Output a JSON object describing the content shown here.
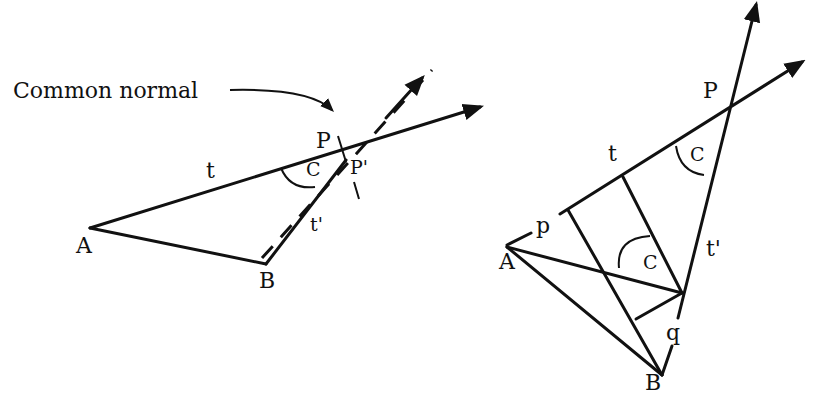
{
  "left_figure": {
    "annotation": "Common normal",
    "labels": {
      "A": "A",
      "B": "B",
      "P": "P",
      "P_prime": "P'",
      "t": "t",
      "t_prime": "t'",
      "angle": "C"
    }
  },
  "right_figure": {
    "labels": {
      "A": "A",
      "B": "B",
      "P": "P",
      "t": "t",
      "t_prime": "t'",
      "p": "p",
      "q": "q",
      "angle_top": "C",
      "angle_mid": "C"
    }
  }
}
